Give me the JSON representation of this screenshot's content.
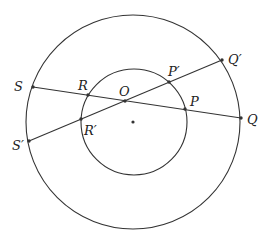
{
  "diagram": {
    "type": "geometry",
    "colors": {
      "stroke": "#333333",
      "background": "#ffffff",
      "text": "#222222"
    },
    "center": {
      "x": 133,
      "y": 122
    },
    "circles": [
      {
        "id": "outer",
        "cx": 133,
        "cy": 122,
        "r": 107
      },
      {
        "id": "inner",
        "cx": 134,
        "cy": 122,
        "r": 53
      }
    ],
    "lines": [
      {
        "id": "SQ",
        "from": "S",
        "to": "Q"
      },
      {
        "id": "S'Q'",
        "from": "S'",
        "to": "Q'"
      }
    ],
    "points": {
      "S": {
        "x": 33,
        "y": 87,
        "label": "S",
        "lx": 14,
        "ly": 91
      },
      "R": {
        "x": 88,
        "y": 95,
        "label": "R",
        "lx": 78,
        "ly": 90
      },
      "O": {
        "x": 125,
        "y": 101,
        "label": "O",
        "lx": 119,
        "ly": 96
      },
      "P": {
        "x": 185,
        "y": 109,
        "label": "P",
        "lx": 190,
        "ly": 106
      },
      "Q": {
        "x": 241,
        "y": 118,
        "label": "Q",
        "lx": 247,
        "ly": 124
      },
      "S'": {
        "x": 29,
        "y": 141,
        "label": "S′",
        "lx": 12,
        "ly": 150
      },
      "R'": {
        "x": 81,
        "y": 119,
        "label": "R′",
        "lx": 84,
        "ly": 135
      },
      "P'": {
        "x": 169,
        "y": 82,
        "label": "P′",
        "lx": 168,
        "ly": 76
      },
      "Q'": {
        "x": 222,
        "y": 60,
        "label": "Q′",
        "lx": 228,
        "ly": 64
      }
    }
  }
}
